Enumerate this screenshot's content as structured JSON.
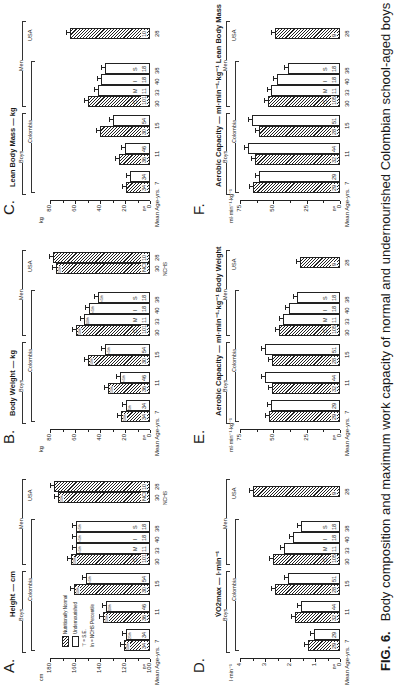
{
  "figure": {
    "label": "FIG. 6.",
    "caption": "Body composition and maximum work capacity of normal and undernourished Colombian school-aged boys and adult agricultural"
  },
  "legend": {
    "normal": "Nutritionally Normal",
    "under": "Undernourished",
    "se": "= S.E.",
    "pct": "In = NCHS Percentile"
  },
  "groups": {
    "boys": "Boys",
    "men": "Men",
    "colombia": "Colombia",
    "usa": "USA"
  },
  "x_axis": {
    "label": "Mean Age-yrs.",
    "n_label": "n=",
    "ages": [
      "7",
      "11",
      "15",
      "30",
      "33",
      "40",
      "38",
      "28"
    ],
    "nchs_label": "NCHS",
    "men_classes": [
      "C",
      "M",
      "I",
      "S"
    ]
  },
  "chart_data": [
    {
      "panel": "A.",
      "type": "bar",
      "title": "Height — cm",
      "ylabel": "cm",
      "ylim": [
        100,
        180
      ],
      "yticks": [
        "100",
        "120",
        "140",
        "160",
        "180"
      ],
      "categories": [
        "Boys 7 N",
        "Boys 7 U",
        "Boys 11 N",
        "Boys 11 U",
        "Boys 15 N",
        "Boys 15 U",
        "Men C 30",
        "Men M 33",
        "Men I 40",
        "Men S 38",
        "USA NCHS 30",
        "USA 28"
      ],
      "values": [
        121,
        119,
        138,
        135,
        161,
        151,
        163,
        159,
        159,
        159,
        174,
        177
      ],
      "n": [
        "34",
        "34",
        "36",
        "46",
        "30",
        "54",
        "101",
        "11",
        "18",
        "18",
        "NCHS",
        "10"
      ],
      "percentiles": [
        "50th",
        "25th",
        "50th",
        "10th",
        "50th",
        "<5th",
        "50th",
        "<5th",
        "<5th",
        "<5th",
        "50th",
        ""
      ]
    },
    {
      "panel": "B.",
      "type": "bar",
      "title": "Body Weight — kg",
      "ylabel": "kg",
      "ylim": [
        0,
        80
      ],
      "yticks": [
        "0",
        "20",
        "40",
        "60",
        "80"
      ],
      "categories": [
        "Boys 7 N",
        "Boys 7 U",
        "Boys 11 N",
        "Boys 11 U",
        "Boys 15 N",
        "Boys 15 U",
        "Men C 30",
        "Men M 33",
        "Men I 40",
        "Men S 38",
        "USA NCHS 30",
        "USA 28"
      ],
      "values": [
        23,
        19,
        34,
        24,
        50,
        36,
        59,
        53,
        49,
        42,
        75,
        78
      ],
      "n": [
        "34",
        "34",
        "36",
        "46",
        "30",
        "54",
        "101",
        "11",
        "18",
        "18",
        "NCHS",
        "10"
      ],
      "percentiles": [
        "50th",
        "5th",
        "50th",
        "<5th",
        "50th",
        "<5th",
        "50th",
        "10th",
        "<5th",
        "<5th",
        "50th",
        ""
      ]
    },
    {
      "panel": "C.",
      "type": "bar",
      "title": "Lean Body Mass — kg",
      "ylabel": "kg",
      "ylim": [
        0,
        80
      ],
      "yticks": [
        "0",
        "20",
        "40",
        "60",
        "80"
      ],
      "categories": [
        "Boys 7 N",
        "Boys 7 U",
        "Boys 11 N",
        "Boys 11 U",
        "Boys 15 N",
        "Boys 15 U",
        "Men C 30",
        "Men M 33",
        "Men I 40",
        "Men S 38",
        "USA 28"
      ],
      "values": [
        19,
        16,
        25,
        20,
        40,
        30,
        50,
        42,
        39,
        36,
        64
      ],
      "n": [
        "34",
        "34",
        "36",
        "46",
        "30",
        "54",
        "101",
        "11",
        "18",
        "18",
        "10"
      ]
    },
    {
      "panel": "D.",
      "type": "bar",
      "title": "V̇O2max — l·min⁻¹",
      "ylabel": "l·min⁻¹",
      "ylim": [
        0,
        4
      ],
      "yticks": [
        "0",
        "1",
        "2",
        "3",
        "4"
      ],
      "categories": [
        "Boys 7 N",
        "Boys 7 U",
        "Boys 11 N",
        "Boys 11 U",
        "Boys 15 N",
        "Boys 15 U",
        "Men C 30",
        "Men M 33",
        "Men I 40",
        "Men S 38",
        "USA 28"
      ],
      "values": [
        1.3,
        1.05,
        1.8,
        1.55,
        2.6,
        2.1,
        2.7,
        2.25,
        1.9,
        1.55,
        3.5
      ],
      "n": [
        "29",
        "29",
        "32",
        "44",
        "28",
        "51",
        "105",
        "11",
        "18",
        "18",
        "9"
      ]
    },
    {
      "panel": "E.",
      "type": "bar",
      "title": "Aerobic Capacity — ml·min⁻¹·kg⁻¹ Body Weight",
      "ylabel": "ml·min⁻¹·kg⁻¹",
      "ylim": [
        0,
        75
      ],
      "yticks": [
        "0",
        "25",
        "50",
        "75"
      ],
      "categories": [
        "Boys 7 N",
        "Boys 7 U",
        "Boys 11 N",
        "Boys 11 U",
        "Boys 15 N",
        "Boys 15 U",
        "Men C 30",
        "Men M 33",
        "Men I 40",
        "Men S 38",
        "USA 28"
      ],
      "values": [
        53,
        52,
        51,
        56,
        51,
        56,
        46,
        43,
        38,
        32,
        30
      ],
      "n": [
        "29",
        "29",
        "32",
        "44",
        "28",
        "51",
        "105",
        "11",
        "18",
        "18",
        "9"
      ]
    },
    {
      "panel": "F.",
      "type": "bar",
      "title": "Aerobic Capacity — ml·min⁻¹·kg⁻¹ Lean Body Mass",
      "ylabel": "ml·min⁻¹·kg⁻¹",
      "ylim": [
        0,
        75
      ],
      "yticks": [
        "0",
        "25",
        "50",
        "75"
      ],
      "categories": [
        "Boys 7 N",
        "Boys 7 U",
        "Boys 11 N",
        "Boys 11 U",
        "Boys 15 N",
        "Boys 15 U",
        "Men C 30",
        "Men M 33",
        "Men I 40",
        "Men S 38",
        "USA 28"
      ],
      "values": [
        65,
        61,
        64,
        69,
        61,
        66,
        54,
        52,
        47,
        39,
        49
      ],
      "n": [
        "29",
        "29",
        "32",
        "44",
        "28",
        "51",
        "105",
        "11",
        "18",
        "18",
        "9"
      ]
    }
  ]
}
